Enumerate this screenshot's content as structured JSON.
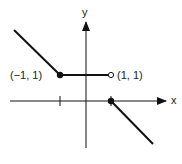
{
  "figure": {
    "type": "piecewise-function-graph",
    "axes": {
      "x_label": "x",
      "y_label": "y",
      "ticks": [
        -1,
        1
      ]
    },
    "points": [
      {
        "label": "(−1, 1)",
        "x": -1,
        "y": 1,
        "style": "filled"
      },
      {
        "label": "(1, 1)",
        "x": 1,
        "y": 1,
        "style": "open"
      },
      {
        "label": "",
        "x": 1,
        "y": 0,
        "style": "filled"
      }
    ],
    "segments": [
      {
        "name": "left-ray",
        "description": "line with slope -1 for x < -1, ending at (-1, 1)"
      },
      {
        "name": "middle-segment",
        "description": "horizontal y = 1 from x = -1 to x = 1"
      },
      {
        "name": "right-ray",
        "description": "line with slope -1 for x >= 1, starting at (1, 0)"
      }
    ],
    "colors": {
      "stroke": "#111111",
      "background": "#ffffff"
    }
  }
}
